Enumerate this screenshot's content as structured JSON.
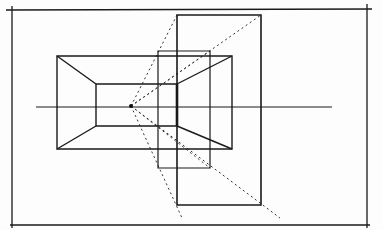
{
  "diagram": {
    "type": "one-point-perspective-sketch",
    "width": 383,
    "height": 230,
    "colors": {
      "background": "#fdfdfd",
      "ink": "#1a1a1a",
      "dotted": "#333333"
    },
    "frame": {
      "x1": 12,
      "y1": 10,
      "x2": 367,
      "y2": 225,
      "top_extend": [
        6,
        372
      ],
      "left_extend": [
        6,
        228
      ]
    },
    "horizon": {
      "x1": 36,
      "y1": 107,
      "x2": 332,
      "y2": 107
    },
    "vanishing_point": {
      "cx": 131,
      "cy": 106,
      "r": 2
    },
    "outer_box": {
      "x": 57,
      "y": 56,
      "w": 175,
      "h": 93
    },
    "inner_box": {
      "x": 96,
      "y": 84,
      "w": 81,
      "h": 42
    },
    "mid_rect": {
      "x": 158,
      "y": 51,
      "w": 52,
      "h": 117
    },
    "tall_rect": {
      "x": 177,
      "y": 15,
      "w": 84,
      "h": 190
    },
    "dotted_rays": [
      {
        "x1": 131,
        "y1": 106,
        "x2": 177,
        "y2": 15
      },
      {
        "x1": 131,
        "y1": 106,
        "x2": 261,
        "y2": 15
      },
      {
        "x1": 131,
        "y1": 106,
        "x2": 182,
        "y2": 218
      },
      {
        "x1": 131,
        "y1": 106,
        "x2": 280,
        "y2": 218
      },
      {
        "x1": 131,
        "y1": 106,
        "x2": 210,
        "y2": 51
      },
      {
        "x1": 131,
        "y1": 106,
        "x2": 210,
        "y2": 168
      }
    ]
  }
}
